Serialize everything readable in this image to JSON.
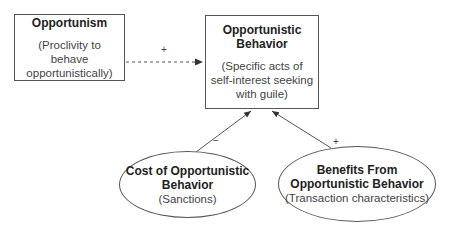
{
  "nodes": {
    "opportunism": {
      "title": "Opportunism",
      "sub": "(Proclivity to behave opportunistically)"
    },
    "behavior": {
      "title": "Opportunistic Behavior",
      "sub": "(Specific acts of self-interest seeking with guile)"
    },
    "cost": {
      "title": "Cost of Opportunistic Behavior",
      "sub": "(Sanctions)"
    },
    "benefits": {
      "title": "Benefits From Opportunistic Behavior",
      "sub": "(Transaction characteristics)"
    }
  },
  "edges": {
    "opportunism_to_behavior": {
      "label": "+",
      "style": "dashed"
    },
    "cost_to_behavior": {
      "label": "−",
      "style": "solid"
    },
    "benefits_to_behavior": {
      "label": "+",
      "style": "solid"
    }
  }
}
